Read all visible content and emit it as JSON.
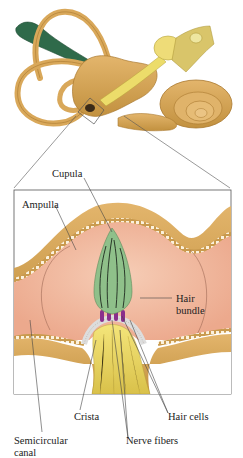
{
  "diagram": {
    "overview": {
      "structures": [
        "semicircular-canals",
        "vestibule",
        "cochlea",
        "vestibular-nerve",
        "endolymphatic-duct"
      ],
      "inset_marker": "ampulla highlight box"
    },
    "labels": {
      "cupula": "Cupula",
      "ampulla": "Ampulla",
      "hair_bundle_1": "Hair",
      "hair_bundle_2": "bundle",
      "crista": "Crista",
      "hair_cells": "Hair cells",
      "nerve_fibers": "Nerve fibers",
      "semicircular_1": "Semicircular",
      "semicircular_2": "canal"
    },
    "colors": {
      "bone_tan": "#d9a85a",
      "bone_shadow": "#b88637",
      "endolymph_pink": "#f2b9a0",
      "cupula_green": "#8fc08a",
      "hair_cell_purple": "#8a2e8c",
      "nerve_yellow": "#ecdc6a",
      "duct_green": "#2f6a4a",
      "leader_line": "#444444"
    }
  }
}
